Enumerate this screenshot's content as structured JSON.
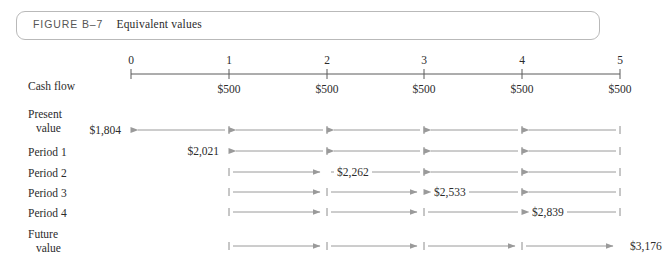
{
  "figure": {
    "label": "FIGURE B–7",
    "title": "Equivalent values",
    "border_color": "#b9b9b9"
  },
  "axis": {
    "row_label": "Cash flow",
    "ticks": [
      "0",
      "1",
      "2",
      "3",
      "4",
      "5"
    ],
    "tick_x": [
      131,
      229,
      327,
      424,
      522,
      620
    ],
    "line_color": "#5a5a5a",
    "cash_flows": [
      {
        "period": "1",
        "value": "$500"
      },
      {
        "period": "2",
        "value": "$500"
      },
      {
        "period": "3",
        "value": "$500"
      },
      {
        "period": "4",
        "value": "$500"
      },
      {
        "period": "5",
        "value": "$500"
      }
    ]
  },
  "arrow_color": "#9a9a9a",
  "tick_mark_color": "#8e8e8e",
  "rows": [
    {
      "id": "present-value",
      "label_lines": [
        "Present",
        "value"
      ],
      "value": "$1,804",
      "value_at_tick": 0,
      "value_side": "right",
      "y": 130,
      "segments": [
        {
          "from": 5,
          "to": 4,
          "dir": "left"
        },
        {
          "from": 4,
          "to": 3,
          "dir": "left"
        },
        {
          "from": 3,
          "to": 2,
          "dir": "left"
        },
        {
          "from": 2,
          "to": 1,
          "dir": "left"
        },
        {
          "from": 1,
          "to": 0,
          "dir": "left"
        }
      ],
      "tick_marks": [
        1,
        2,
        3,
        4,
        5
      ]
    },
    {
      "id": "period-1",
      "label_lines": [
        "Period 1"
      ],
      "value": "$2,021",
      "value_at_tick": 1,
      "value_side": "right",
      "y": 151,
      "segments": [
        {
          "from": 5,
          "to": 4,
          "dir": "left"
        },
        {
          "from": 4,
          "to": 3,
          "dir": "left"
        },
        {
          "from": 3,
          "to": 2,
          "dir": "left"
        },
        {
          "from": 2,
          "to": 1,
          "dir": "left"
        }
      ],
      "tick_marks": [
        2,
        3,
        4,
        5
      ]
    },
    {
      "id": "period-2",
      "label_lines": [
        "Period 2"
      ],
      "value": "$2,262",
      "value_at_tick": 2,
      "value_side": "left",
      "y": 172,
      "segments": [
        {
          "from": 1,
          "to": 2,
          "dir": "right"
        },
        {
          "from": 2,
          "to": 3,
          "dir": "plain"
        },
        {
          "from": 4,
          "to": 3,
          "dir": "left"
        },
        {
          "from": 5,
          "to": 4,
          "dir": "left"
        }
      ],
      "tick_marks": [
        1,
        3,
        4,
        5
      ]
    },
    {
      "id": "period-3",
      "label_lines": [
        "Period 3"
      ],
      "value": "$2,533",
      "value_at_tick": 3,
      "value_side": "left",
      "y": 192,
      "segments": [
        {
          "from": 1,
          "to": 2,
          "dir": "right"
        },
        {
          "from": 2,
          "to": 3,
          "dir": "right"
        },
        {
          "from": 4,
          "to": 3,
          "dir": "left"
        },
        {
          "from": 5,
          "to": 4,
          "dir": "left"
        }
      ],
      "tick_marks": [
        1,
        2,
        4,
        5
      ]
    },
    {
      "id": "period-4",
      "label_lines": [
        "Period 4"
      ],
      "value": "$2,839",
      "value_at_tick": 4,
      "value_side": "left",
      "y": 212,
      "segments": [
        {
          "from": 1,
          "to": 2,
          "dir": "right"
        },
        {
          "from": 2,
          "to": 3,
          "dir": "right"
        },
        {
          "from": 3,
          "to": 4,
          "dir": "plain"
        },
        {
          "from": 5,
          "to": 4,
          "dir": "left"
        }
      ],
      "tick_marks": [
        1,
        2,
        3,
        5
      ]
    },
    {
      "id": "future-value",
      "label_lines": [
        "Future",
        "value"
      ],
      "value": "$3,176",
      "value_at_tick": 5,
      "value_side": "left",
      "y": 246,
      "segments": [
        {
          "from": 1,
          "to": 2,
          "dir": "right"
        },
        {
          "from": 2,
          "to": 3,
          "dir": "right"
        },
        {
          "from": 3,
          "to": 4,
          "dir": "right"
        },
        {
          "from": 4,
          "to": 5,
          "dir": "right"
        }
      ],
      "tick_marks": [
        1,
        2,
        3,
        4
      ]
    }
  ],
  "label_rows": [
    {
      "id": "present-value",
      "lines": [
        {
          "text": "Present",
          "x": 28,
          "y": 108
        },
        {
          "text": "value",
          "x": 36,
          "y": 122
        }
      ]
    },
    {
      "id": "period-1",
      "lines": [
        {
          "text": "Period 1",
          "x": 28,
          "y": 146
        }
      ]
    },
    {
      "id": "period-2",
      "lines": [
        {
          "text": "Period 2",
          "x": 28,
          "y": 167
        }
      ]
    },
    {
      "id": "period-3",
      "lines": [
        {
          "text": "Period 3",
          "x": 28,
          "y": 187
        }
      ]
    },
    {
      "id": "period-4",
      "lines": [
        {
          "text": "Period 4",
          "x": 28,
          "y": 207
        }
      ]
    },
    {
      "id": "future-value",
      "lines": [
        {
          "text": "Future",
          "x": 28,
          "y": 228
        },
        {
          "text": "value",
          "x": 36,
          "y": 242
        }
      ]
    }
  ]
}
